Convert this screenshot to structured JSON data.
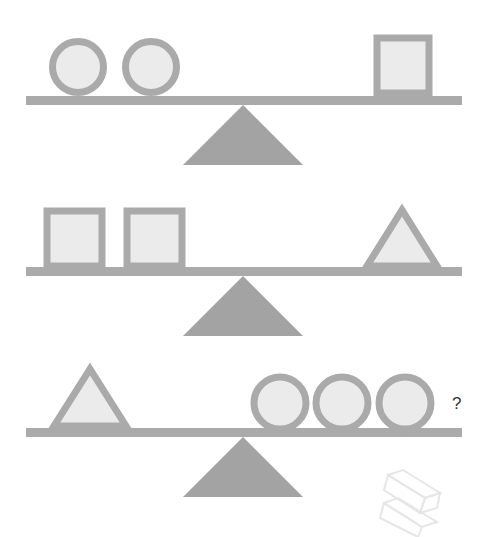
{
  "puzzle": {
    "type": "balance-scale-puzzle",
    "colors": {
      "beam": "#aaaaaa",
      "fulcrum": "#a3a3a3",
      "shape_fill": "#ebebeb",
      "shape_stroke": "#aaaaaa"
    },
    "scales": [
      {
        "left": [
          "circle",
          "circle"
        ],
        "right": [
          "square"
        ]
      },
      {
        "left": [
          "square",
          "square"
        ],
        "right": [
          "triangle"
        ]
      },
      {
        "left": [
          "triangle"
        ],
        "right": [
          "circle",
          "circle",
          "circle"
        ],
        "annotation": "?"
      }
    ]
  },
  "question_mark": "?"
}
